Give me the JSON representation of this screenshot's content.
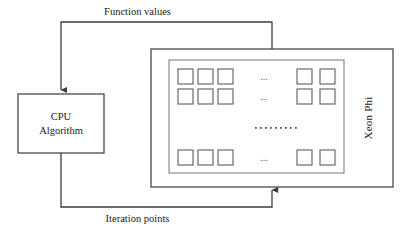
{
  "diagram": {
    "type": "block-flow",
    "title_visible": false,
    "stroke_color": "#4a4a4a",
    "text_color": "#1a1a1a",
    "background_color": "#ffffff",
    "nodes": {
      "cpu": {
        "line1": "CPU",
        "line2": "Algorithm",
        "x": 18,
        "y": 94,
        "w": 86,
        "h": 59
      },
      "accelerator": {
        "label": "Xeon Phi",
        "outer": {
          "x": 151,
          "y": 49,
          "w": 242,
          "h": 138
        },
        "inner": {
          "x": 169,
          "y": 60,
          "w": 175,
          "h": 113
        }
      }
    },
    "edges": [
      {
        "name": "function-values",
        "label": "Function values",
        "from": "accelerator",
        "to": "cpu",
        "direction": "right-to-left",
        "arrowhead_at": "cpu-top"
      },
      {
        "name": "iteration-points",
        "label": "Iteration points",
        "from": "cpu",
        "to": "accelerator",
        "direction": "left-to-right",
        "arrowhead_at": "accelerator-bottom"
      }
    ],
    "core_grid": {
      "square_size": 15,
      "rows": [
        {
          "name": "row-1",
          "y": 69,
          "left_squares_x": [
            178,
            198,
            218
          ],
          "ellipsis_x": 264,
          "ellipsis_text": "...",
          "right_squares_x": [
            297,
            320
          ]
        },
        {
          "name": "row-2",
          "y": 89,
          "left_squares_x": [
            178,
            198,
            218
          ],
          "ellipsis_x": 264,
          "ellipsis_text": "...",
          "right_squares_x": [
            297,
            320
          ]
        },
        {
          "name": "row-3",
          "y": 150,
          "left_squares_x": [
            178,
            198,
            218
          ],
          "ellipsis_x": 264,
          "ellipsis_text": "...",
          "right_squares_x": [
            297,
            320
          ]
        }
      ],
      "vertical_ellipsis": {
        "name": "dot-row",
        "y": 128,
        "x_start": 255,
        "dot_count": 9,
        "dot_spacing": 5,
        "dot_size": 1.6
      }
    }
  }
}
